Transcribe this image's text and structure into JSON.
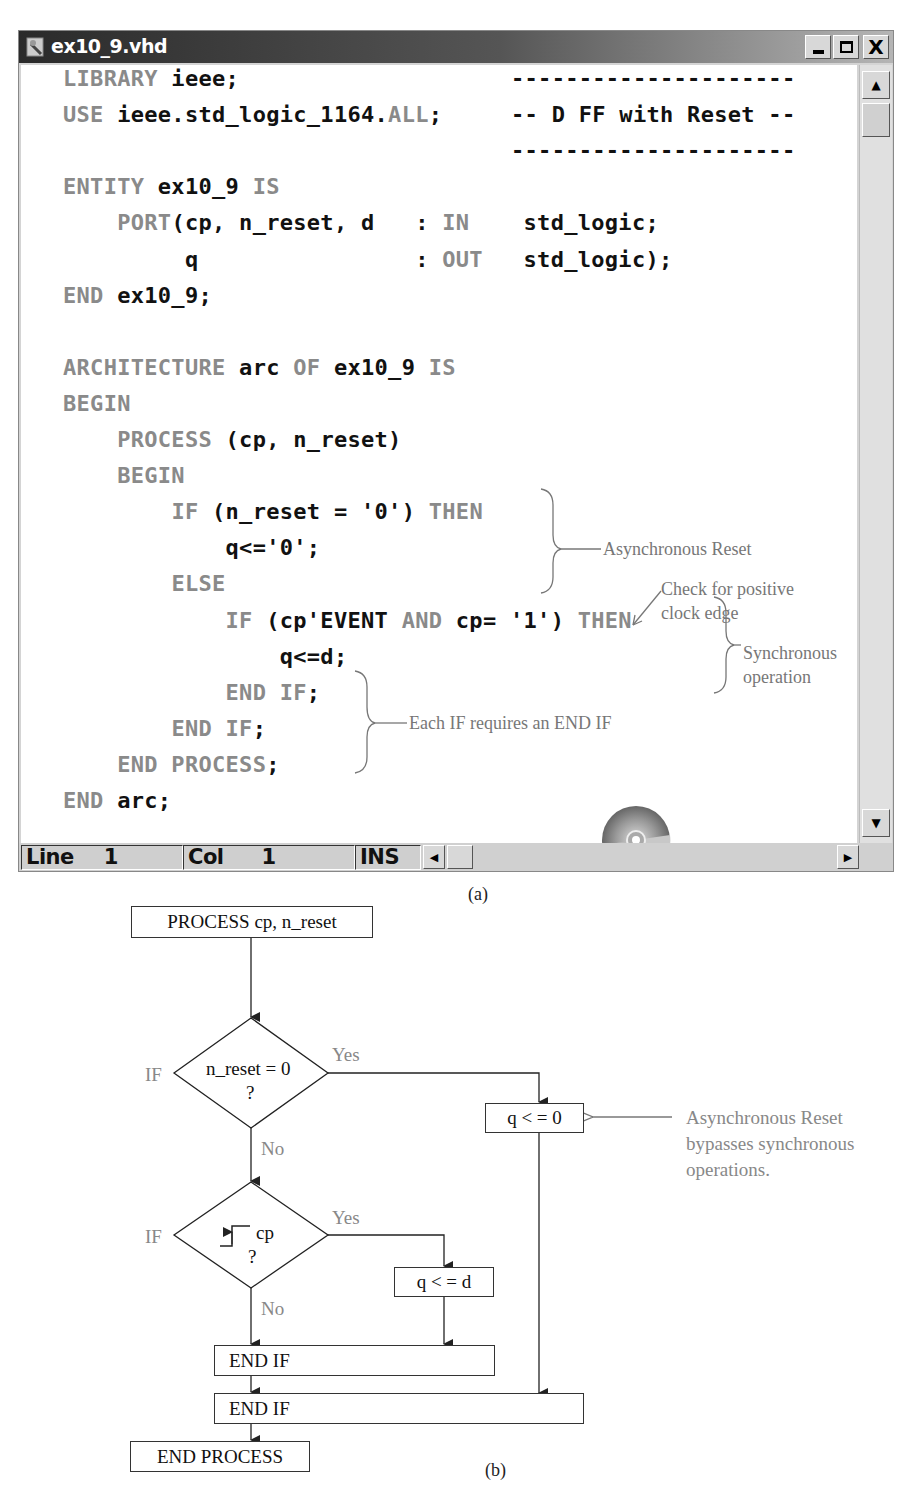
{
  "window": {
    "title": "ex10_9.vhd",
    "buttons": {
      "minimize": "_",
      "maximize": "□",
      "close": "X"
    },
    "code": [
      [
        {
          "t": "LIBRARY",
          "k": 1
        },
        {
          "t": " ieee;"
        }
      ],
      [
        {
          "t": "USE",
          "k": 1
        },
        {
          "t": " ieee.std_logic_1164."
        },
        {
          "t": "ALL",
          "k": 1
        },
        {
          "t": ";"
        }
      ],
      [],
      [
        {
          "t": "ENTITY",
          "k": 1
        },
        {
          "t": " ex10_9 "
        },
        {
          "t": "IS",
          "k": 1
        }
      ],
      [
        {
          "t": "    "
        },
        {
          "t": "PORT",
          "k": 1
        },
        {
          "t": "(cp, n_reset, d   : "
        },
        {
          "t": "IN",
          "k": 1
        },
        {
          "t": "    std_logic;"
        }
      ],
      [
        {
          "t": "         q                : "
        },
        {
          "t": "OUT",
          "k": 1
        },
        {
          "t": "   std_logic);"
        }
      ],
      [
        {
          "t": "END",
          "k": 1
        },
        {
          "t": " ex10_9;"
        }
      ],
      [],
      [
        {
          "t": "ARCHITECTURE",
          "k": 1
        },
        {
          "t": " arc "
        },
        {
          "t": "OF",
          "k": 1
        },
        {
          "t": " ex10_9 "
        },
        {
          "t": "IS",
          "k": 1
        }
      ],
      [
        {
          "t": "BEGIN",
          "k": 1
        }
      ],
      [
        {
          "t": "    "
        },
        {
          "t": "PROCESS",
          "k": 1
        },
        {
          "t": " (cp, n_reset)"
        }
      ],
      [
        {
          "t": "    "
        },
        {
          "t": "BEGIN",
          "k": 1
        }
      ],
      [
        {
          "t": "        "
        },
        {
          "t": "IF",
          "k": 1
        },
        {
          "t": " (n_reset = '0') "
        },
        {
          "t": "THEN",
          "k": 1
        }
      ],
      [
        {
          "t": "            q<='0';"
        }
      ],
      [
        {
          "t": "        "
        },
        {
          "t": "ELSE",
          "k": 1
        }
      ],
      [
        {
          "t": "            "
        },
        {
          "t": "IF",
          "k": 1
        },
        {
          "t": " (cp'EVENT "
        },
        {
          "t": "AND",
          "k": 1
        },
        {
          "t": " cp= '1') "
        },
        {
          "t": "THEN",
          "k": 1
        }
      ],
      [
        {
          "t": "                q<=d;"
        }
      ],
      [
        {
          "t": "            "
        },
        {
          "t": "END IF",
          "k": 1
        },
        {
          "t": ";"
        }
      ],
      [
        {
          "t": "        "
        },
        {
          "t": "END IF",
          "k": 1
        },
        {
          "t": ";"
        }
      ],
      [
        {
          "t": "    "
        },
        {
          "t": "END PROCESS",
          "k": 1
        },
        {
          "t": ";"
        }
      ],
      [
        {
          "t": "END",
          "k": 1
        },
        {
          "t": " arc;"
        }
      ]
    ],
    "comment_block": {
      "rule": "---------------------",
      "text": "-- D FF with Reset --"
    },
    "annotations": {
      "async_reset": "Asynchronous Reset",
      "check_edge_1": "Check for positive",
      "check_edge_2": "clock edge",
      "sync_op_1": "Synchronous",
      "sync_op_2": "operation",
      "end_if": "Each IF requires an END IF"
    },
    "cd_label": "ex10_9.vhd",
    "status": {
      "line_label": "Line",
      "line_value": "1",
      "col_label": "Col",
      "col_value": "1",
      "mode": "INS"
    },
    "caption": "(a)"
  },
  "flowchart": {
    "process_start": "PROCESS cp, n_reset",
    "decision1": {
      "label": "n_reset = 0",
      "q": "?",
      "side": "IF",
      "yes": "Yes",
      "no": "No"
    },
    "assign_reset": "q < = 0",
    "note": [
      "Asynchronous Reset",
      "bypasses synchronous",
      "operations."
    ],
    "decision2": {
      "label": "cp",
      "q": "?",
      "side": "IF",
      "yes": "Yes",
      "no": "No",
      "icon": "rising-edge-icon"
    },
    "assign_d": "q < = d",
    "end_if_inner": "END IF",
    "end_if_outer": "END IF",
    "process_end": "END PROCESS",
    "caption": "(b)"
  },
  "colors": {
    "keyword": "#8a8a8a",
    "identifier": "#111111",
    "annotation": "#777777",
    "titlebar_dark": "#2a2a2a",
    "window_gray": "#d4d4d4"
  }
}
